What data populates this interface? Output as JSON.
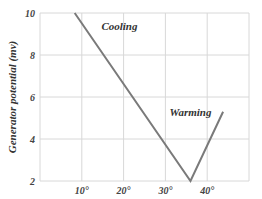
{
  "chart_data": {
    "type": "line",
    "title": "",
    "xlabel": "",
    "ylabel": "Generator potential (mv)",
    "xlim": [
      0,
      50
    ],
    "ylim": [
      2,
      10
    ],
    "grid": true,
    "x_ticks": [
      10,
      20,
      30,
      40
    ],
    "x_tick_labels": [
      "10°",
      "20°",
      "30°",
      "40°"
    ],
    "y_ticks": [
      2,
      4,
      6,
      8,
      10
    ],
    "y_tick_labels": [
      "2",
      "4",
      "6",
      "8",
      "10"
    ],
    "series": [
      {
        "name": "Generator potential",
        "x": [
          8.3,
          36,
          43.8
        ],
        "y": [
          10,
          2,
          5.3
        ]
      }
    ],
    "annotations": [
      {
        "text": "Cooling",
        "x": 19,
        "y": 9.2
      },
      {
        "text": "Warming",
        "x": 36,
        "y": 5.1
      }
    ]
  }
}
